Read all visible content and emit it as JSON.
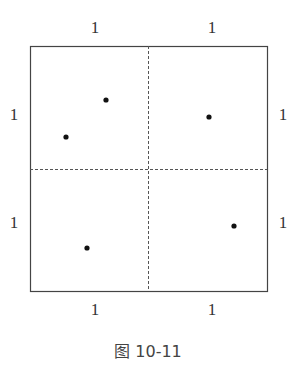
{
  "figure": {
    "caption": "图 10-11",
    "square": {
      "x": 30,
      "y": 46,
      "width": 237,
      "height": 245
    },
    "midlines": {
      "vertical_x": 148,
      "horizontal_y": 169,
      "style": "dashed"
    },
    "points": [
      {
        "x": 106,
        "y": 100
      },
      {
        "x": 66,
        "y": 137
      },
      {
        "x": 209,
        "y": 117
      },
      {
        "x": 87,
        "y": 248
      },
      {
        "x": 234,
        "y": 226
      }
    ],
    "labels": {
      "top_left": "1",
      "top_right": "1",
      "left_top": "1",
      "left_bottom": "1",
      "right_top": "1",
      "right_bottom": "1",
      "bottom_left": "1",
      "bottom_right": "1"
    }
  }
}
